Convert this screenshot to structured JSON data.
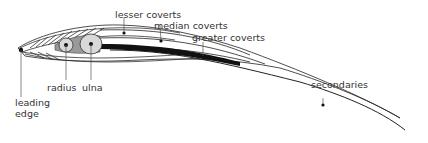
{
  "labels": {
    "lesser_coverts": "lesser coverts",
    "median_coverts": "median coverts",
    "greater_coverts": "greater coverts",
    "radius": "radius",
    "ulna": "ulna",
    "leading_edge_line1": "leading",
    "leading_edge_line2": "edge",
    "secondaries": "secondaries"
  },
  "colors": {
    "line": "#222222",
    "bone_fill": "#d9d9d9",
    "bone_shaft": "#999999",
    "text": "#333333"
  }
}
